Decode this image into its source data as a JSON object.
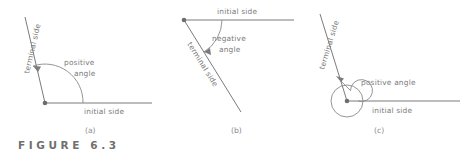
{
  "figure": {
    "caption": "FIGURE 6.3",
    "panels": [
      {
        "letter": "(a)",
        "terminal_label": "terminal side",
        "initial_label": "initial side",
        "angle_label_line1": "positive",
        "angle_label_line2": "angle",
        "angle_label_full": "positive angle",
        "rotation_direction": "counterclockwise",
        "arc_sweep_degrees": 110
      },
      {
        "letter": "(b)",
        "terminal_label": "terminal side",
        "initial_label": "initial side",
        "angle_label_line1": "negative",
        "angle_label_line2": "angle",
        "angle_label_full": "negative angle",
        "rotation_direction": "clockwise",
        "arc_sweep_degrees": 65
      },
      {
        "letter": "(c)",
        "terminal_label": "terminal side",
        "initial_label": "initial side",
        "angle_label_line1": "positive angle",
        "angle_label_line2": "",
        "angle_label_full": "positive angle",
        "rotation_direction": "counterclockwise",
        "arc_sweep_degrees": 470
      }
    ]
  },
  "colors": {
    "line": "#7b7b7b",
    "text": "#7a7a7a",
    "caption": "#6f6f6f",
    "background": "#ffffff"
  }
}
